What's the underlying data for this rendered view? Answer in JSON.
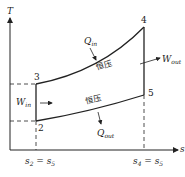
{
  "diagram": {
    "type": "T-s diagram (Brayton cycle)",
    "axes": {
      "y_label": "T",
      "x_label": "s"
    },
    "points": [
      {
        "id": "2",
        "label": "2"
      },
      {
        "id": "3",
        "label": "3"
      },
      {
        "id": "4",
        "label": "4"
      },
      {
        "id": "5",
        "label": "5"
      }
    ],
    "x_ticks": {
      "left": {
        "main": "s",
        "sub1": "2",
        "eq": " = s",
        "sub2": "5"
      },
      "right": {
        "main": "s",
        "sub1": "4",
        "eq": " = s",
        "sub2": "5"
      }
    },
    "annotations": {
      "q_in": {
        "main": "Q",
        "sub": "in"
      },
      "q_out": {
        "main": "Q",
        "sub": "out"
      },
      "w_in": {
        "main": "W",
        "sub": "in"
      },
      "w_out": {
        "main": "W",
        "sub": "out"
      },
      "upper_process": "恒压",
      "lower_process": "恒压"
    },
    "colors": {
      "line": "#222222"
    }
  }
}
